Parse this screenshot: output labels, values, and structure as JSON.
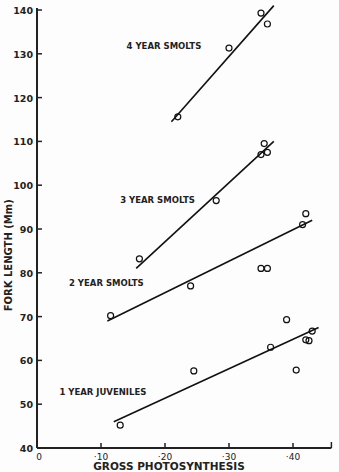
{
  "chart_data": {
    "type": "scatter",
    "title": "",
    "xlabel": "GROSS PHOTOSYNTHESIS",
    "ylabel": "FORK LENGTH (Mm)",
    "xlim": [
      0,
      0.46
    ],
    "ylim": [
      40,
      140
    ],
    "x_ticks": [
      "0",
      "·10",
      "·20",
      "·30",
      "·40"
    ],
    "x_tick_values": [
      0,
      0.1,
      0.2,
      0.3,
      0.4
    ],
    "y_ticks": [
      "40",
      "50",
      "60",
      "70",
      "80",
      "90",
      "100",
      "110",
      "120",
      "130",
      "140"
    ],
    "y_tick_values": [
      40,
      50,
      60,
      70,
      80,
      90,
      100,
      110,
      120,
      130,
      140
    ],
    "grid": false,
    "legend": "none (inline labels)",
    "series": [
      {
        "name": "4 YEAR SMOLTS",
        "label_pos": [
          0.14,
          131
        ],
        "points": [
          [
            0.22,
            115.6
          ],
          [
            0.3,
            131.3
          ],
          [
            0.35,
            139.3
          ],
          [
            0.36,
            136.8
          ]
        ],
        "fit_line": [
          [
            0.21,
            114.5
          ],
          [
            0.37,
            141
          ]
        ]
      },
      {
        "name": "3 YEAR SMOLTS",
        "label_pos": [
          0.13,
          96
        ],
        "points": [
          [
            0.16,
            83.2
          ],
          [
            0.28,
            96.5
          ],
          [
            0.35,
            107
          ],
          [
            0.355,
            109.5
          ],
          [
            0.36,
            107.5
          ]
        ],
        "fit_line": [
          [
            0.155,
            81
          ],
          [
            0.37,
            110
          ]
        ]
      },
      {
        "name": "2 YEAR SMOLTS",
        "label_pos": [
          0.05,
          77
        ],
        "points": [
          [
            0.115,
            70.2
          ],
          [
            0.24,
            77
          ],
          [
            0.35,
            81
          ],
          [
            0.36,
            81
          ],
          [
            0.415,
            91
          ],
          [
            0.42,
            93.5
          ]
        ],
        "fit_line": [
          [
            0.11,
            69
          ],
          [
            0.43,
            92
          ]
        ]
      },
      {
        "name": "1 YEAR JUVENILES",
        "label_pos": [
          0.035,
          52
        ],
        "points": [
          [
            0.13,
            45.2
          ],
          [
            0.245,
            57.6
          ],
          [
            0.365,
            63
          ],
          [
            0.39,
            69.3
          ],
          [
            0.405,
            57.8
          ],
          [
            0.42,
            64.7
          ],
          [
            0.425,
            64.5
          ],
          [
            0.43,
            66.7
          ]
        ],
        "fit_line": [
          [
            0.12,
            46
          ],
          [
            0.44,
            67.5
          ]
        ]
      }
    ]
  }
}
